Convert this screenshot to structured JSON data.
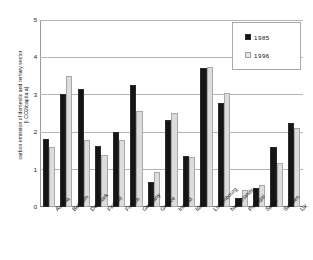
{
  "chart_data": {
    "type": "bar",
    "title": "",
    "xlabel": "",
    "ylabel_lines": [
      "carbon emission of domestic and tertiary sector",
      "[t CO2/capita a]"
    ],
    "ylim": [
      0,
      5
    ],
    "yticks": [
      0,
      1,
      2,
      3,
      4,
      5
    ],
    "ytick_labels": [
      "0",
      "1",
      "2",
      "3",
      "4",
      "5"
    ],
    "grid": true,
    "legend_position": "top-right",
    "categories": [
      "Austria",
      "Belgium",
      "Denmark",
      "Finland",
      "France",
      "Germany",
      "Greece",
      "Ireland",
      "Italy",
      "Luxembourg",
      "Netherlands",
      "Portugal",
      "Spain",
      "Sweden",
      "UK"
    ],
    "series": [
      {
        "name": "1985",
        "color": "#151515",
        "values": [
          1.82,
          3.02,
          3.15,
          1.62,
          2.0,
          3.25,
          0.68,
          2.33,
          1.37,
          3.72,
          2.78,
          0.23,
          0.52,
          1.6,
          2.25
        ]
      },
      {
        "name": "1996",
        "color": "#dcdcdc",
        "values": [
          1.6,
          3.5,
          1.78,
          1.38,
          1.78,
          2.57,
          0.93,
          2.52,
          1.35,
          3.75,
          3.05,
          0.45,
          0.58,
          1.18,
          2.1
        ]
      }
    ]
  }
}
